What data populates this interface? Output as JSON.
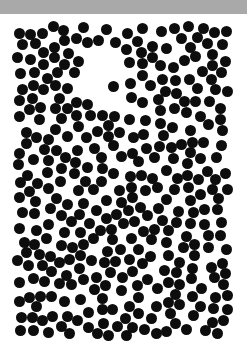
{
  "image": {
    "description": "Black dot pattern perceptual illusion with a hidden white shape near the upper middle",
    "top_bar_color": "#a9a9a9",
    "background_color": "#ffffff",
    "dot_color": "#0d0d0d"
  },
  "dot_field": {
    "seed": 20240611,
    "bounds": {
      "x_min": 17,
      "x_max": 228,
      "y_min": 26,
      "y_max": 336
    },
    "dot_diameter": 11,
    "min_spacing": 10.5,
    "attempts": 9000,
    "exclusion_ellipses": [
      {
        "cx": 103,
        "cy": 78,
        "rx": 26,
        "ry": 32
      },
      {
        "cx": 118,
        "cy": 105,
        "rx": 14,
        "ry": 16
      },
      {
        "cx": 92,
        "cy": 55,
        "rx": 16,
        "ry": 12
      }
    ],
    "explicit_dots": [
      {
        "x": 113,
        "y": 86
      },
      {
        "x": 114,
        "y": 116
      },
      {
        "x": 108,
        "y": 136
      }
    ]
  },
  "labels": {
    "canvas_label": "Dot pattern"
  }
}
